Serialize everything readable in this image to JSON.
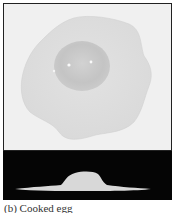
{
  "figure": {
    "top_panel": {
      "description": "top view of fried egg on light background",
      "background_color": "#f0f0f0",
      "white_color": "#dedede",
      "yolk_color": "#c8c8c8"
    },
    "bottom_panel": {
      "description": "side profile silhouette of egg on black background",
      "background_color": "#050505",
      "profile_color": "#d8d8d8"
    },
    "caption": "(b) Cooked egg"
  }
}
